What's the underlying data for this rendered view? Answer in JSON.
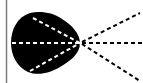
{
  "diagram": {
    "type": "optics-ray-diagram",
    "background": "#ffffff",
    "border_line": {
      "x": 6,
      "color": "#7a7a7a"
    },
    "blob": {
      "name": "eye-lens-shape",
      "color": "#000000"
    },
    "focal_point": {
      "x": 80,
      "y": 43
    },
    "ray_color_inside": "#ffffff",
    "ray_color_outside": "#000000",
    "rays": [
      {
        "name": "upper-ray",
        "start": [
          32,
          17
        ],
        "end": [
          140,
          13
        ]
      },
      {
        "name": "center-ray",
        "start": [
          12,
          43
        ],
        "end": [
          140,
          43
        ]
      },
      {
        "name": "lower-ray",
        "start": [
          30,
          72
        ],
        "end": [
          140,
          81
        ]
      }
    ]
  }
}
